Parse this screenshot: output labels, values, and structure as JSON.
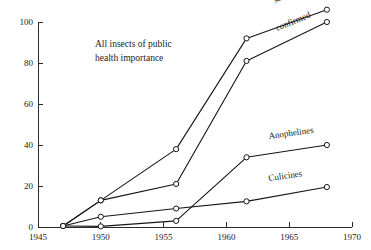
{
  "chart_data": {
    "type": "line",
    "title": "",
    "annotation": {
      "line1": "All insects of public",
      "line2": "health  importance"
    },
    "xlabel": "",
    "ylabel": "",
    "xlim": [
      1945,
      1970
    ],
    "ylim": [
      0,
      100
    ],
    "xticks": [
      1945,
      1950,
      1955,
      1960,
      1965,
      1970
    ],
    "xticklabels": [
      "1945",
      "1950",
      "1955",
      "1960",
      "1965",
      "1970"
    ],
    "yticks": [
      0,
      20,
      40,
      60,
      80,
      100
    ],
    "yticklabels": [
      "0",
      "20",
      "40",
      "60",
      "80",
      "100"
    ],
    "grid": false,
    "legend_position": "inline-end-of-line",
    "marker": "open-circle",
    "series": [
      {
        "name": "suspected",
        "label": "suspected",
        "label_rotation": -22,
        "x": [
          1947,
          1950,
          1956,
          1961.6,
          1968
        ],
        "y": [
          0.5,
          13,
          38,
          92,
          106
        ]
      },
      {
        "name": "confirmed",
        "label": "confirmed",
        "label_rotation": -22,
        "x": [
          1947,
          1950,
          1956,
          1961.6,
          1968
        ],
        "y": [
          0.5,
          13,
          21,
          81,
          100
        ]
      },
      {
        "name": "Anophelines",
        "label": "Anophelines",
        "label_rotation": -8,
        "x": [
          1947,
          1950,
          1956,
          1961.6,
          1968
        ],
        "y": [
          0.5,
          0.3,
          3,
          34,
          40
        ]
      },
      {
        "name": "Culicines",
        "label": "Culicines",
        "label_rotation": -8,
        "x": [
          1947,
          1950,
          1956,
          1961.6,
          1968
        ],
        "y": [
          0.5,
          5,
          9,
          12.5,
          19.5
        ]
      }
    ],
    "colors": {
      "line": "#151515",
      "axis": "#2b2b2b",
      "marker_fill": "#ffffff",
      "background": "#ffffff"
    }
  }
}
